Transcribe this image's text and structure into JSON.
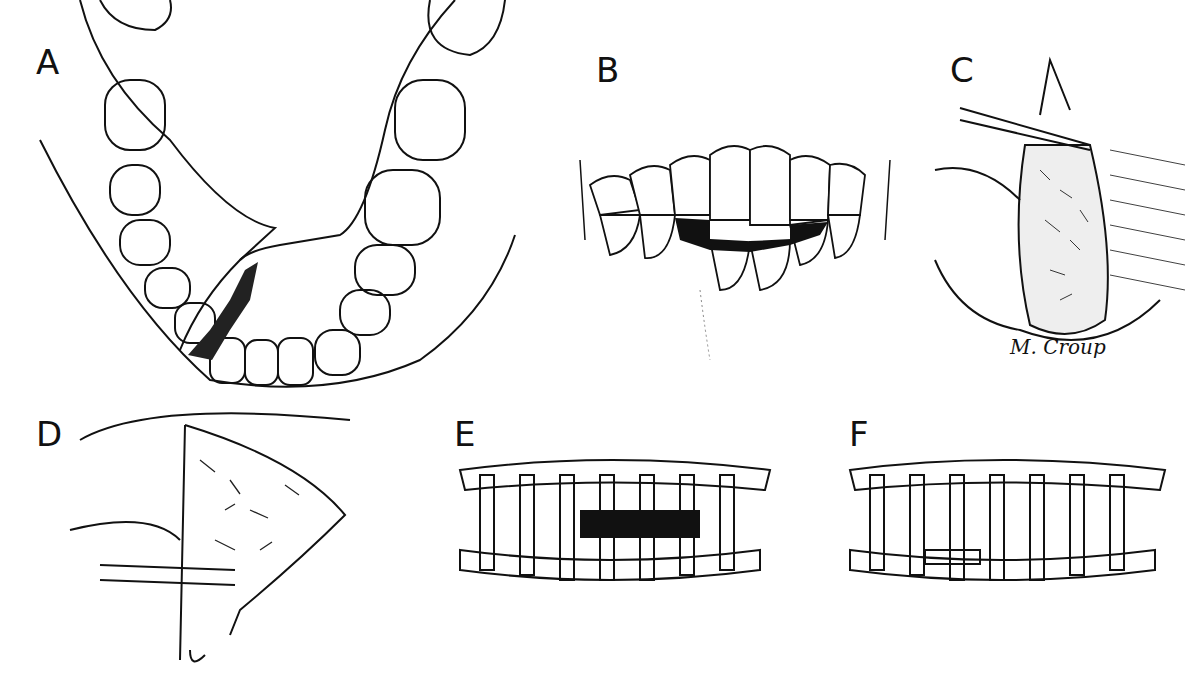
{
  "figure": {
    "panels": [
      {
        "id": "A",
        "label": "A",
        "description": "Mandible occlusal view with fracture line"
      },
      {
        "id": "B",
        "label": "B",
        "description": "Frontal view of teeth with malocclusion"
      },
      {
        "id": "C",
        "label": "C",
        "description": "Cross-section of bone with wire loop"
      },
      {
        "id": "D",
        "label": "D",
        "description": "Sagittal section with wire through bone"
      },
      {
        "id": "E",
        "label": "E",
        "description": "Arch bars applied, gap visible"
      },
      {
        "id": "F",
        "label": "F",
        "description": "Arch bars applied with reduction"
      }
    ],
    "signature": "M. Croup"
  }
}
